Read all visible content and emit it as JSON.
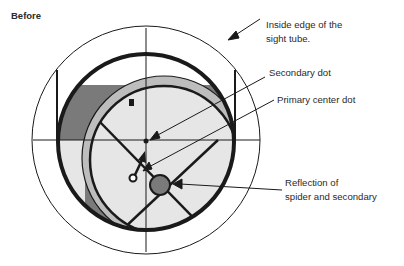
{
  "title": "Before",
  "labels": {
    "sight_tube_line1": "Inside edge of the",
    "sight_tube_line2": "sight tube.",
    "secondary_dot": "Secondary dot",
    "primary_center_dot": "Primary center dot",
    "reflection_line1": "Reflection of",
    "reflection_line2": "spider and secondary"
  },
  "colors": {
    "line": "#1a1a1a",
    "dark_gray": "#7a7a7a",
    "light_gray": "#e6e6e6",
    "background": "#ffffff"
  }
}
